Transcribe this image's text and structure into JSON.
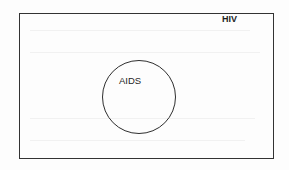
{
  "diagram": {
    "type": "venn-subset",
    "sets": [
      {
        "id": "hiv",
        "label": "HIV",
        "shape": "rectangle",
        "role": "universal-set"
      },
      {
        "id": "aids",
        "label": "AIDS",
        "shape": "circle",
        "role": "subset",
        "contained_in": "hiv"
      }
    ],
    "colors": {
      "stroke": "#333333",
      "text": "#1f1f1f",
      "background": "#fdfdfd"
    }
  }
}
